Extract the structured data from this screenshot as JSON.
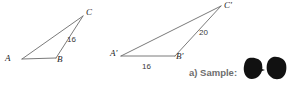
{
  "figure": {
    "background_color": "#ffffff",
    "stroke_color": "#6b6b6b",
    "label_color": "#1c1c1c",
    "caption_color": "#6e6e6e",
    "blob_color": "#111111"
  },
  "triangle_1": {
    "name": "triangle-abc",
    "vertices": [
      {
        "id": "A",
        "label": "A",
        "x": 22,
        "y": 59,
        "label_x": 5,
        "label_y": 54
      },
      {
        "id": "B",
        "label": "B",
        "x": 56,
        "y": 58,
        "label_x": 57,
        "label_y": 55
      },
      {
        "id": "C",
        "label": "C",
        "x": 83,
        "y": 16,
        "label_x": 86,
        "label_y": 8
      }
    ],
    "sides": [
      {
        "id": "AB",
        "from": "A",
        "to": "B",
        "label": ""
      },
      {
        "id": "AC",
        "from": "A",
        "to": "C",
        "label": ""
      },
      {
        "id": "BC",
        "from": "B",
        "to": "C",
        "label": "16",
        "label_x": 67,
        "label_y": 36
      }
    ]
  },
  "triangle_2": {
    "name": "triangle-a-prime-b-prime-c-prime",
    "vertices": [
      {
        "id": "A'",
        "label": "A'",
        "x": 121,
        "y": 56,
        "label_x": 110,
        "label_y": 49
      },
      {
        "id": "B'",
        "label": "B'",
        "x": 175,
        "y": 56,
        "label_x": 176,
        "label_y": 52
      },
      {
        "id": "C'",
        "label": "C'",
        "x": 221,
        "y": 6,
        "label_x": 224,
        "label_y": 1
      }
    ],
    "sides": [
      {
        "id": "A'B'",
        "from": "A'",
        "to": "B'",
        "label": "16",
        "label_x": 142,
        "label_y": 63
      },
      {
        "id": "A'C'",
        "from": "A'",
        "to": "C'",
        "label": ""
      },
      {
        "id": "B'C'",
        "from": "B'",
        "to": "C'",
        "label": "20",
        "label_x": 199,
        "label_y": 29
      }
    ]
  },
  "annotation": {
    "sample_label": "a) Sample:",
    "sample_label_x": 189,
    "sample_label_y": 68,
    "redacted_shapes": [
      {
        "id": "blob-left",
        "x": 243,
        "y": 57,
        "width": 22,
        "height": 25
      },
      {
        "id": "blob-right",
        "x": 266,
        "y": 56,
        "width": 22,
        "height": 26
      }
    ]
  }
}
